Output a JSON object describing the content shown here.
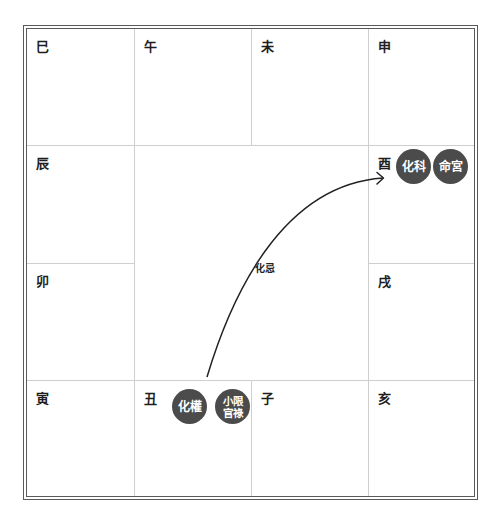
{
  "cells": [
    {
      "label": "巳"
    },
    {
      "label": "午"
    },
    {
      "label": "未"
    },
    {
      "label": "申"
    },
    {
      "label": "辰"
    },
    {
      "label": "酉"
    },
    {
      "label": "卯"
    },
    {
      "label": "戌"
    },
    {
      "label": "寅"
    },
    {
      "label": "丑"
    },
    {
      "label": "子"
    },
    {
      "label": "亥"
    }
  ],
  "badges": {
    "you_hua_ke": {
      "text": "化科",
      "cell": "酉"
    },
    "you_ming_gong": {
      "text": "命宮",
      "cell": "酉"
    },
    "chou_hua_quan": {
      "text": "化權",
      "cell": "丑"
    },
    "chou_xiao_xian": {
      "line1": "小限",
      "line2": "官祿",
      "cell": "丑"
    }
  },
  "arrow": {
    "label": "化忌",
    "from": "丑",
    "to": "酉"
  },
  "colors": {
    "badge_bg": "#4b4b4b",
    "badge_text": "#ffffff",
    "grid_line": "#cfcfcf",
    "border": "#5a5a5a",
    "arrow": "#222222"
  }
}
